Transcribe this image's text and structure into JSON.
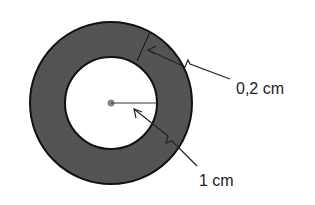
{
  "diagram": {
    "title": "",
    "shape": "annulus",
    "colors": {
      "ring_fill": "#555555",
      "ring_stroke": "#111111",
      "center_dot": "#888888",
      "lines": "#222222"
    },
    "labels": {
      "thickness": "0,2 cm",
      "inner_radius": "1 cm"
    }
  }
}
